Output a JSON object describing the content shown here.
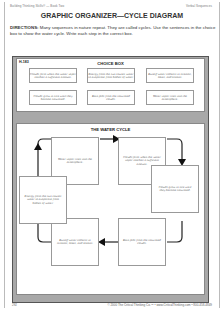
{
  "header": {
    "left": "Building Thinking Skills® — Book Two",
    "right": "Verbal Sequences"
  },
  "title": "GRAPHIC ORGANIZER—CYCLE DIAGRAM",
  "directions": {
    "label": "DIRECTIONS:",
    "text": " Many sequences in nature repeat. They are called cycles. Use the sentences in the choice box to show the water cycle. Write each step in the correct box."
  },
  "choice_box": {
    "code": "H-183",
    "title": "CHOICE BOX",
    "items": [
      "Clouds form when the water vapor reaches a sufficient amount.",
      "Energy from the sun causes water to evaporate from bodies of water.",
      "Runoff water collects in streams, lakes, and oceans.",
      "Clouds grow in size until they become saturated.",
      "Rain falls from the saturated clouds.",
      "Water vapor rises into the atmosphere."
    ]
  },
  "water_cycle": {
    "title": "THE WATER CYCLE",
    "steps": [
      "Water vapor rises into the atmosphere.",
      "Clouds form when the water vapor reaches a sufficient amount.",
      "Clouds grow in size until they become saturated.",
      "Rain falls from the saturated clouds.",
      "Runoff water collects in streams, lakes, and oceans.",
      "Energy from the sun causes water to evaporate from bodies of water."
    ]
  },
  "footer": {
    "page": "292",
    "copyright": "© 2000 The Critical Thinking Co.™ • www.CriticalThinking.com • 800-458-4849"
  }
}
